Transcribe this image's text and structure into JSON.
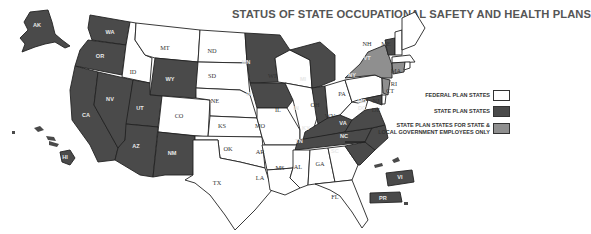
{
  "title": "STATUS OF STATE OCCUPATIONAL SAFETY AND HEALTH PLANS",
  "legend": {
    "items": [
      {
        "label": "FEDERAL PLAN STATES",
        "color": "#ffffff"
      },
      {
        "label": "STATE PLAN STATES",
        "color": "#4a4a4a"
      },
      {
        "label": "STATE PLAN STATES FOR STATE & LOCAL GOVERNMENT EMPLOYEES ONLY",
        "label_line1": "STATE PLAN STATES FOR STATE &",
        "label_line2": "LOCAL GOVERNMENT EMPLOYEES ONLY",
        "color": "#8f8f8f"
      }
    ]
  },
  "categories": {
    "federal_plan_states": [
      "MT",
      "ID",
      "ND",
      "SD",
      "NE",
      "CO",
      "KS",
      "OK",
      "TX",
      "MO",
      "AR",
      "LA",
      "MS",
      "AL",
      "GA",
      "FL",
      "WI",
      "IL",
      "OH",
      "PA",
      "WV",
      "NH",
      "MA",
      "RI",
      "DE",
      "DC"
    ],
    "state_plan_states": [
      "AK",
      "WA",
      "OR",
      "CA",
      "NV",
      "UT",
      "AZ",
      "WY",
      "NM",
      "MN",
      "IA",
      "MI",
      "IN",
      "KY",
      "TN",
      "VA",
      "NC",
      "SC",
      "MD",
      "VT",
      "HI",
      "VI",
      "PR",
      "ME"
    ],
    "state_and_local_government_only": [
      "NY",
      "CT",
      "NJ"
    ]
  },
  "labels": {
    "AK": "AK",
    "WA": "WA",
    "OR": "OR",
    "CA": "CA",
    "NV": "NV",
    "ID": "ID",
    "MT": "MT",
    "WY": "WY",
    "UT": "UT",
    "AZ": "AZ",
    "CO": "CO",
    "NM": "NM",
    "ND": "ND",
    "SD": "SD",
    "NE": "NE",
    "KS": "KS",
    "OK": "OK",
    "TX": "TX",
    "MN": "MN",
    "IA": "IA",
    "MO": "MO",
    "AR": "AR",
    "LA": "LA",
    "WI": "WI",
    "IL": "IL",
    "MI": "MI",
    "IN": "IN",
    "OH": "OH",
    "KY": "KY",
    "TN": "TN",
    "MS": "MS",
    "AL": "AL",
    "GA": "GA",
    "FL": "FL",
    "SC": "SC",
    "NC": "NC",
    "VA": "VA",
    "WV": "WV",
    "PA": "PA",
    "NY": "NY",
    "VT": "VT",
    "NH": "NH",
    "ME": "ME",
    "MA": "MA",
    "RI": "RI",
    "CT": "CT",
    "NJ": "NJ",
    "DE": "DE",
    "MD": "MD",
    "DC": "DC",
    "HI": "HI",
    "VI": "VI",
    "PR": "PR"
  }
}
